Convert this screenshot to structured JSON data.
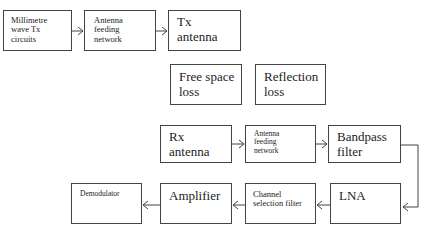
{
  "diagram": {
    "type": "block-diagram",
    "title": "",
    "blocks": [
      {
        "id": "mmwave_tx",
        "label": "Millimetre\nwave Tx\ncircuits"
      },
      {
        "id": "tx_feed",
        "label": "Antenna\nfeeding\nnetwork"
      },
      {
        "id": "tx_antenna",
        "label": "Tx\nantenna"
      },
      {
        "id": "free_space_loss",
        "label": "Free space\nloss"
      },
      {
        "id": "reflection_loss",
        "label": "Reflection\nloss"
      },
      {
        "id": "rx_antenna",
        "label": "Rx\nantenna"
      },
      {
        "id": "rx_feed",
        "label": "Antenna\nfeeding\nnetwork"
      },
      {
        "id": "bandpass",
        "label": "Bandpass\nfilter"
      },
      {
        "id": "lna",
        "label": "LNA"
      },
      {
        "id": "channel_filter",
        "label": "Channel\nselection filter"
      },
      {
        "id": "amplifier",
        "label": "Amplifier"
      },
      {
        "id": "demodulator",
        "label": "Demodulator"
      }
    ],
    "edges": [
      {
        "from": "mmwave_tx",
        "to": "tx_feed"
      },
      {
        "from": "tx_feed",
        "to": "tx_antenna"
      },
      {
        "from": "rx_antenna",
        "to": "rx_feed"
      },
      {
        "from": "rx_feed",
        "to": "bandpass"
      },
      {
        "from": "bandpass",
        "to": "lna"
      },
      {
        "from": "lna",
        "to": "channel_filter"
      },
      {
        "from": "channel_filter",
        "to": "amplifier"
      },
      {
        "from": "amplifier",
        "to": "demodulator"
      }
    ]
  },
  "colors": {
    "stroke": "#444444",
    "background": "#ffffff",
    "text": "#222222"
  }
}
